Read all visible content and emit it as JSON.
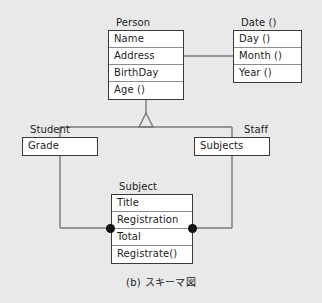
{
  "diagram": {
    "caption": "(b) スキーマ図",
    "background_color": "#e9e9e9",
    "box_fill_color": "#ffffff",
    "border_color": "#3a3a3a",
    "line_color": "#7a7a7a",
    "dot_color": "#111111"
  },
  "classes": {
    "person": {
      "name": "Person",
      "attributes": [
        "Name",
        "Address",
        "BirthDay",
        "Age ()"
      ]
    },
    "date": {
      "name": "Date ()",
      "attributes": [
        "Day ()",
        "Month ()",
        "Year ()"
      ]
    },
    "student": {
      "name": "Student",
      "attributes": [
        "Grade"
      ]
    },
    "staff": {
      "name": "Staff",
      "attributes": [
        "Subjects"
      ]
    },
    "subject": {
      "name": "Subject",
      "attributes": [
        "Title",
        "Registration",
        "Total",
        "Registrate()"
      ]
    }
  },
  "relationships": [
    {
      "kind": "association",
      "from": "Person.Address",
      "to": "Date.Month"
    },
    {
      "kind": "generalization",
      "from": "Person",
      "to": [
        "Student",
        "Staff"
      ]
    },
    {
      "kind": "association",
      "from": "Student.Grade",
      "to": "Subject",
      "endpoint": "filled-circle"
    },
    {
      "kind": "association",
      "from": "Staff.Subjects",
      "to": "Subject",
      "endpoint": "filled-circle"
    }
  ]
}
